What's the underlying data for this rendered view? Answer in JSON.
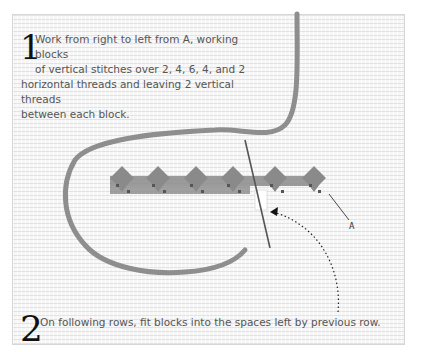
{
  "diagram": {
    "type": "needlepoint-stitch-instruction",
    "colors": {
      "background": "#f6f6f6",
      "yarn": "#8c8c8c",
      "stitch_dark": "#5a5a5a",
      "text": "#555555",
      "step_number": "#111111"
    },
    "steps": [
      {
        "number": "1",
        "line1": "Work from right to left from A, working blocks",
        "line2": "of vertical stitches over 2, 4, 6, 4, and 2",
        "line3": "horizontal threads and leaving 2 vertical threads",
        "line4": "between each block."
      },
      {
        "number": "2",
        "text": "On following rows, fit blocks into the spaces left by previous row."
      }
    ],
    "labels": {
      "point_a": "A"
    },
    "stitch_blocks": {
      "count": 6,
      "pattern": [
        2,
        4,
        6,
        4,
        2
      ]
    }
  }
}
